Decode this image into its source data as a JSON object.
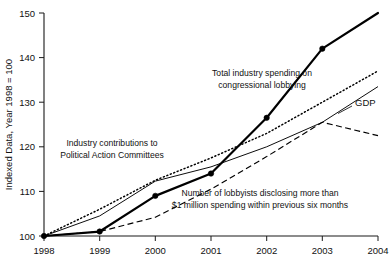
{
  "chart_data": {
    "type": "line",
    "title": "",
    "xlabel": "",
    "ylabel": "Indexed Data, Year 1998 = 100",
    "x": [
      1998,
      1999,
      2000,
      2001,
      2002,
      2003,
      2004
    ],
    "xtick_labels": [
      "1998",
      "1999",
      "2000",
      "2001",
      "2002",
      "2003",
      "2004"
    ],
    "ytick_labels": [
      "100",
      "110",
      "120",
      "130",
      "140",
      "150"
    ],
    "ytick_values": [
      100,
      110,
      120,
      130,
      140,
      150
    ],
    "xlim": [
      1998,
      2004
    ],
    "ylim": [
      100,
      150
    ],
    "grid": false,
    "legend_position": "inline-annotations",
    "series": [
      {
        "name": "Total industry spending on congressional lobbying",
        "style": "thick-solid-with-markers",
        "markers": true,
        "x": [
          1998,
          1999,
          2000,
          2001,
          2002,
          2003,
          2004
        ],
        "values": [
          100,
          101,
          109,
          114,
          126.5,
          142,
          150
        ]
      },
      {
        "name": "Industry contributions to Political Action Committees",
        "style": "dotted",
        "markers": false,
        "x": [
          1998,
          1999,
          2000,
          2001,
          2002,
          2003,
          2004
        ],
        "values": [
          100,
          106,
          112.5,
          117.5,
          123,
          130,
          137
        ]
      },
      {
        "name": "GDP",
        "style": "thin-solid",
        "markers": false,
        "x": [
          1998,
          1999,
          2000,
          2001,
          2002,
          2003,
          2004
        ],
        "values": [
          100,
          104.5,
          112.3,
          115.5,
          120,
          125.5,
          133.5
        ]
      },
      {
        "name": "Number of lobbyists disclosing more than $1 million spending within previous six months",
        "style": "dashed",
        "markers": false,
        "x": [
          1998,
          1999,
          2000,
          2001,
          2002,
          2003,
          2004
        ],
        "values": [
          100,
          101,
          104.2,
          110.5,
          117.8,
          125.5,
          122.5
        ]
      }
    ],
    "annotations": [
      {
        "id": "lobbying",
        "line1": "Total industry spending on",
        "line2": "congressional lobbying"
      },
      {
        "id": "pac",
        "line1": "Industry contributions to",
        "line2": "Political Action Committees"
      },
      {
        "id": "lobbyists",
        "line1": "Number of lobbyists disclosing more than",
        "line2": "$1 million spending within previous six months"
      },
      {
        "id": "gdp",
        "line1": "GDP"
      }
    ]
  }
}
